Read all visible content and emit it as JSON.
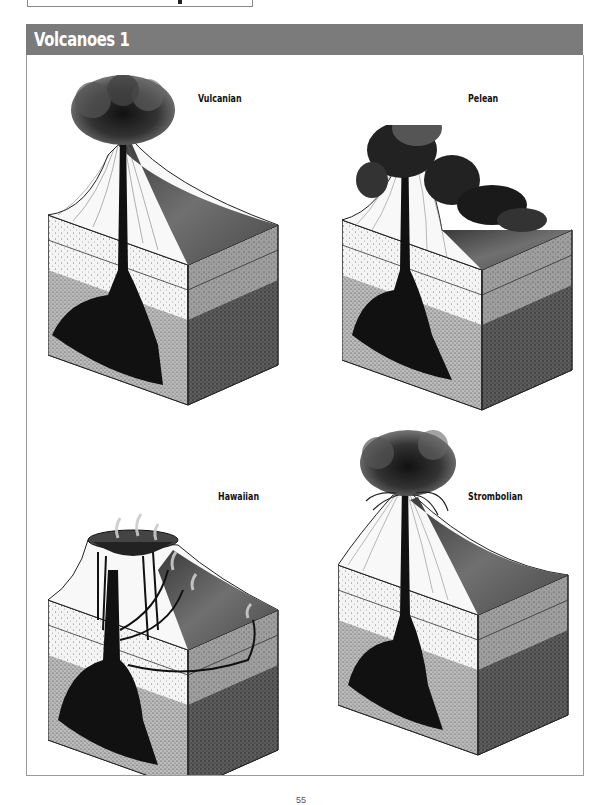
{
  "page": {
    "section_title": "Volcanoes 1",
    "page_number": "55"
  },
  "colors": {
    "header_bar": "#7b7b7b",
    "header_text": "#ffffff",
    "frame_border": "#9a9a9a",
    "magma": "#111111"
  },
  "diagrams": [
    {
      "label": "Vulcanian",
      "icon": "volcano-vulcanian-icon"
    },
    {
      "label": "Pelean",
      "icon": "volcano-pelean-icon"
    },
    {
      "label": "Hawaiian",
      "icon": "volcano-hawaiian-icon"
    },
    {
      "label": "Strombolian",
      "icon": "volcano-strombolian-icon"
    }
  ]
}
